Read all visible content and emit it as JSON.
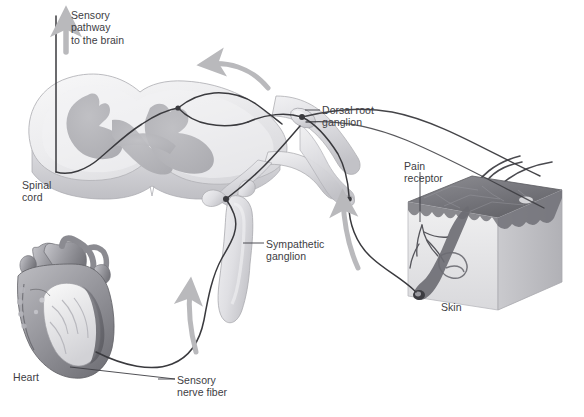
{
  "figure": {
    "kind": "anatomical-illustration",
    "background_color": "#ffffff",
    "text_color": "#3d3d43",
    "nerve_fiber_color": "#3a3a3e",
    "arrow_color": "#b9b9bc",
    "tissue_light": "#ededee",
    "tissue_mid": "#cfcfd2",
    "gray_matter": "#b6b6ba"
  },
  "labels": {
    "sensory_pathway": "Sensory\npathway\nto the brain",
    "spinal_cord": "Spinal\ncord",
    "dorsal_root_ganglion": "Dorsal root\nganglion",
    "pain_receptor": "Pain\nreceptor",
    "sympathetic_ganglion": "Sympathetic\nganglion",
    "skin": "Skin",
    "heart": "Heart",
    "sensory_nerve_fiber": "Sensory\nnerve fiber"
  },
  "structures": [
    {
      "name": "spinal-cord",
      "description": "Cross-section of spinal cord with butterfly-shaped gray matter"
    },
    {
      "name": "dorsal-root-ganglion",
      "description": "Swelling on dorsal root where sensory cell bodies reside"
    },
    {
      "name": "sympathetic-ganglion",
      "description": "Elongated ganglion of sympathetic chain below the spinal nerve"
    },
    {
      "name": "heart",
      "description": "Cut-away heart with aorta and great vessels"
    },
    {
      "name": "skin-block",
      "description": "Cube of skin with epidermis, hairs and nerve endings"
    },
    {
      "name": "pain-receptor",
      "description": "Free nerve endings branching in the dermis"
    }
  ],
  "arrows": [
    {
      "name": "arrow-sensory-pathway-to-brain",
      "direction": "up",
      "meaning": "Ascending sensory pathway to the brain"
    },
    {
      "name": "arrow-along-dorsal-root",
      "direction": "left",
      "meaning": "Impulse travelling toward the spinal cord"
    },
    {
      "name": "arrow-from-skin",
      "direction": "up",
      "meaning": "Impulse from skin pain receptor"
    },
    {
      "name": "arrow-from-heart",
      "direction": "up",
      "meaning": "Impulse from heart along sensory nerve fiber"
    }
  ]
}
